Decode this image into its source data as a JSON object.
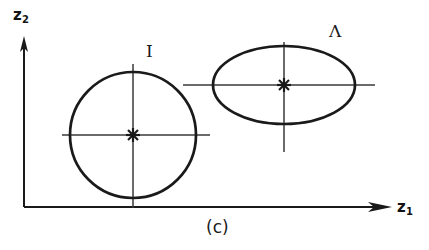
{
  "figure": {
    "caption": "(c)",
    "axes": {
      "x_label_base": "z",
      "x_label_sub": "1",
      "y_label_base": "z",
      "y_label_sub": "2",
      "x_axis_arrow": "arrow-right",
      "y_axis_arrow": "arrow-up",
      "origin": {
        "x": 24,
        "y": 207
      },
      "x_axis_end": {
        "x": 383,
        "y": 207
      },
      "y_axis_end": {
        "x": 24,
        "y": 42
      }
    },
    "shapes": [
      {
        "id": "circle-I",
        "label": "I",
        "type": "circle",
        "center": {
          "x": 133,
          "y": 135
        },
        "radius_x": 63,
        "radius_y": 63,
        "center_marker": "cross-star",
        "crosshair_h": {
          "x1": 62,
          "x2": 210
        },
        "crosshair_v": {
          "y1": 64,
          "y2": 208
        },
        "stroke": "#1a1a1a",
        "stroke_width": 2.6
      },
      {
        "id": "ellipse-Lambda",
        "label": "Λ",
        "type": "ellipse",
        "center": {
          "x": 284,
          "y": 85
        },
        "radius_x": 71,
        "radius_y": 39,
        "center_marker": "cross-star",
        "crosshair_h": {
          "x1": 183,
          "x2": 375
        },
        "crosshair_v": {
          "y1": 42,
          "y2": 152
        },
        "stroke": "#1a1a1a",
        "stroke_width": 2.6
      }
    ],
    "colors": {
      "ink": "#1a1a1a",
      "thin_ink": "#3a3a3a",
      "background": "#ffffff"
    }
  }
}
